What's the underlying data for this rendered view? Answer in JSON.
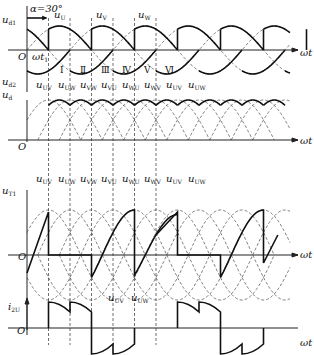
{
  "figure": {
    "alpha_label": "α=30°",
    "origin_label": "O",
    "x_axis_label": "ωt",
    "t1_label": "ωt",
    "t1_sub": "1",
    "panels": [
      {
        "id": "ud1_ud2",
        "y_labels": [
          {
            "main": "u",
            "sub": "d1"
          },
          {
            "main": "u",
            "sub": "d2"
          }
        ],
        "phase_labels": [
          {
            "main": "u",
            "sub": "U"
          },
          {
            "main": "u",
            "sub": "V"
          },
          {
            "main": "u",
            "sub": "W"
          }
        ],
        "intervals": [
          "Ⅰ",
          "Ⅱ",
          "Ⅲ",
          "Ⅳ",
          "Ⅴ",
          "Ⅵ"
        ]
      },
      {
        "id": "ud",
        "y_label": {
          "main": "u",
          "sub": "d"
        },
        "line_labels": [
          {
            "main": "u",
            "sub": "UV"
          },
          {
            "main": "u",
            "sub": "UW"
          },
          {
            "main": "u",
            "sub": "VW"
          },
          {
            "main": "u",
            "sub": "VU"
          },
          {
            "main": "u",
            "sub": "WU"
          },
          {
            "main": "u",
            "sub": "WV"
          },
          {
            "main": "u",
            "sub": "UV"
          },
          {
            "main": "u",
            "sub": "UW"
          }
        ]
      },
      {
        "id": "uT1",
        "y_label": {
          "main": "u",
          "sub": "T1"
        },
        "line_labels": [
          {
            "main": "u",
            "sub": "UV"
          },
          {
            "main": "u",
            "sub": "UW"
          },
          {
            "main": "u",
            "sub": "VW"
          },
          {
            "main": "u",
            "sub": "VU"
          },
          {
            "main": "u",
            "sub": "WU"
          },
          {
            "main": "u",
            "sub": "WV"
          },
          {
            "main": "u",
            "sub": "UV"
          },
          {
            "main": "u",
            "sub": "UW"
          }
        ],
        "bottom_labels": [
          {
            "main": "u",
            "sub": "UV"
          },
          {
            "main": "u",
            "sub": "UW"
          }
        ]
      },
      {
        "id": "i2U",
        "y_label": {
          "main": "i",
          "sub": "2U"
        }
      }
    ]
  }
}
